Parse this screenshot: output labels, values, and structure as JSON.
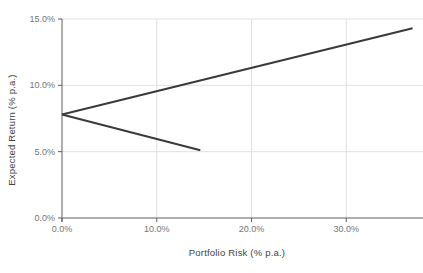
{
  "chart_data": {
    "type": "line",
    "title": "",
    "xlabel": "Portfolio Risk (% p.a.)",
    "ylabel": "Expected Return (% p.a.)",
    "xlim": [
      0,
      38.1
    ],
    "ylim": [
      0,
      15
    ],
    "grid": true,
    "legend": "none",
    "x_ticks": {
      "values": [
        0,
        10,
        20,
        30
      ],
      "labels": [
        "0.0%",
        "10.0%",
        "20.0%",
        "30.0%"
      ]
    },
    "y_ticks": {
      "values": [
        0,
        5,
        10,
        15
      ],
      "labels": [
        "0.0%",
        "5.0%",
        "10.0%",
        "15.0%"
      ]
    },
    "series": [
      {
        "name": "frontier-upper-segment",
        "x": [
          0.0,
          37.0
        ],
        "y": [
          7.8,
          14.3
        ],
        "color": "#3a3a3a",
        "width": 2
      },
      {
        "name": "frontier-lower-segment",
        "x": [
          0.0,
          14.6
        ],
        "y": [
          7.8,
          5.1
        ],
        "color": "#3a3a3a",
        "width": 2
      }
    ],
    "colors": {
      "gridline": "#e0e0e0",
      "axis_line": "#5f5f5f",
      "tick_label": "#757575",
      "axis_title": "#424242",
      "background": "#ffffff"
    }
  }
}
